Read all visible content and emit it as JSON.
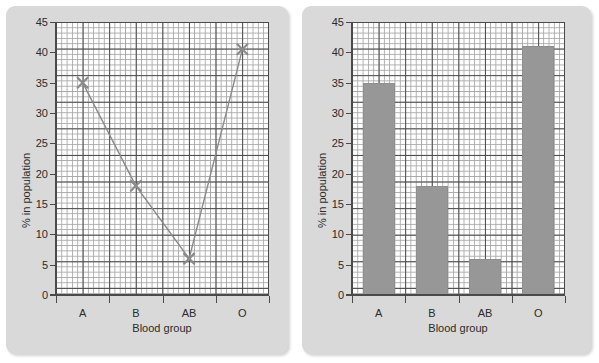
{
  "figure": {
    "panels": [
      {
        "id": "line-panel",
        "chart_title": "",
        "xlabel": "Blood group",
        "ylabel": "% in population"
      },
      {
        "id": "bar-panel",
        "chart_title": "",
        "xlabel": "Blood group",
        "ylabel": "% in population"
      }
    ],
    "colors": {
      "panel_background": "#d9d9d9",
      "plot_background": "#ffffff",
      "major_grid": "#4a4a4a",
      "minor_grid": "#a8a8a8",
      "bar_fill": "#979797",
      "line_stroke": "#8a8a8a",
      "marker": "#8a8a8a",
      "text": "#2b2b2b"
    }
  },
  "chart_data": [
    {
      "type": "line",
      "title": "",
      "xlabel": "Blood group",
      "ylabel": "% in population",
      "categories": [
        "A",
        "B",
        "AB",
        "O"
      ],
      "values": [
        35,
        18,
        6,
        40.5
      ],
      "ylim": [
        0,
        45
      ],
      "yticks": [
        0,
        5,
        10,
        15,
        20,
        25,
        30,
        35,
        40,
        45
      ],
      "ytick_labels": [
        "0",
        "5",
        "10",
        "15",
        "20",
        "25",
        "30",
        "35",
        "40",
        "45"
      ],
      "xtick_labels": [
        "A",
        "B",
        "AB",
        "O"
      ],
      "grid": true,
      "minor_grid": true,
      "legend": false,
      "marker": "x",
      "series": [
        {
          "name": "% in population",
          "values": [
            35,
            18,
            6,
            40.5
          ]
        }
      ]
    },
    {
      "type": "bar",
      "title": "",
      "xlabel": "Blood group",
      "ylabel": "% in population",
      "categories": [
        "A",
        "B",
        "AB",
        "O"
      ],
      "values": [
        35,
        18,
        6,
        41
      ],
      "ylim": [
        0,
        45
      ],
      "yticks": [
        0,
        5,
        10,
        15,
        20,
        25,
        30,
        35,
        40,
        45
      ],
      "ytick_labels": [
        "0",
        "5",
        "10",
        "15",
        "20",
        "25",
        "30",
        "35",
        "40",
        "45"
      ],
      "xtick_labels": [
        "A",
        "B",
        "AB",
        "O"
      ],
      "grid": true,
      "minor_grid": true,
      "legend": false,
      "series": [
        {
          "name": "% in population",
          "values": [
            35,
            18,
            6,
            41
          ]
        }
      ]
    }
  ]
}
